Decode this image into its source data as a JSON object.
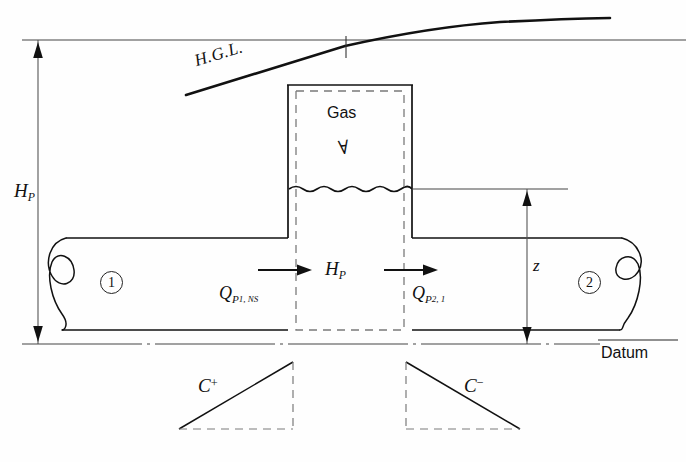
{
  "figure": {
    "type": "engineering-diagram",
    "background_color": "#fefefe",
    "line_color": "#1a1a1a"
  },
  "labels": {
    "hgl": "H.G.L.",
    "head_left": "H",
    "head_left_sub": "P",
    "head_center": "H",
    "head_center_sub": "P",
    "gas": "Gas",
    "gas_volume_symbol": "∀",
    "elevation_z": "z",
    "datum": "Datum",
    "section_one": "1",
    "section_two": "2",
    "flow_in": "Q",
    "flow_in_sub": "P",
    "flow_in_sub_num": "1",
    "flow_in_sub_tail": ", NS",
    "flow_out": "Q",
    "flow_out_sub": "P",
    "flow_out_sub_num": "2",
    "flow_out_sub_tail": ", 1",
    "char_positive": "C",
    "char_positive_sup": "+",
    "char_negative": "C",
    "char_negative_sup": "−"
  },
  "geometry": {
    "reference_line_y": 40,
    "datum_y": 344,
    "pipe_top_y": 238,
    "pipe_bottom_y": 330,
    "chamber_left_x": 288,
    "chamber_right_x": 412,
    "chamber_top_y": 85,
    "water_surface_y": 189,
    "cv_left_x": 296,
    "cv_right_x": 404,
    "cv_top_y": 91,
    "cv_bottom_y": 330,
    "hp_arrow_x": 38,
    "z_arrow_x": 527
  },
  "colors": {
    "stroke": "#1a1a1a",
    "dashed": "#6b6b6b",
    "thin": "#444444"
  }
}
